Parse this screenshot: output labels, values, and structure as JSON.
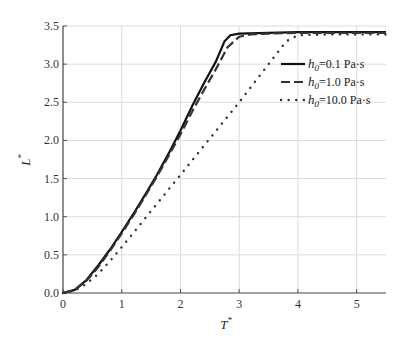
{
  "chart_data": {
    "type": "line",
    "title": "",
    "xlabel": "T*",
    "ylabel": "L*",
    "xlim": [
      0,
      5.5
    ],
    "ylim": [
      0,
      3.5
    ],
    "xticks": [
      "0",
      "1",
      "2",
      "3",
      "4",
      "5"
    ],
    "yticks": [
      "0.0",
      "0.5",
      "1.0",
      "1.5",
      "2.0",
      "2.5",
      "3.0",
      "3.5"
    ],
    "grid": true,
    "legend_position": "upper right",
    "series": [
      {
        "name": "h0 = 0.1 Pa·s",
        "style": "solid",
        "x": [
          0,
          0.2,
          0.4,
          0.6,
          0.8,
          1.0,
          1.2,
          1.4,
          1.6,
          1.8,
          2.0,
          2.2,
          2.4,
          2.6,
          2.75,
          2.85,
          3.0,
          3.5,
          4.0,
          4.5,
          5.0,
          5.5
        ],
        "y": [
          0,
          0.04,
          0.17,
          0.36,
          0.57,
          0.8,
          1.04,
          1.29,
          1.55,
          1.83,
          2.13,
          2.45,
          2.75,
          3.03,
          3.3,
          3.38,
          3.4,
          3.41,
          3.42,
          3.42,
          3.42,
          3.42
        ]
      },
      {
        "name": "h0 = 1.0 Pa·s",
        "style": "dashed",
        "x": [
          0,
          0.2,
          0.4,
          0.6,
          0.8,
          1.0,
          1.2,
          1.4,
          1.6,
          1.8,
          2.0,
          2.2,
          2.4,
          2.6,
          2.8,
          3.0,
          3.2,
          3.5,
          4.0,
          4.5,
          5.0,
          5.5
        ],
        "y": [
          0,
          0.04,
          0.16,
          0.34,
          0.55,
          0.78,
          1.02,
          1.27,
          1.53,
          1.8,
          2.08,
          2.38,
          2.66,
          2.93,
          3.22,
          3.36,
          3.39,
          3.4,
          3.41,
          3.41,
          3.41,
          3.41
        ]
      },
      {
        "name": "h0 = 10.0 Pa·s",
        "style": "dotted",
        "x": [
          0,
          0.2,
          0.4,
          0.6,
          0.8,
          1.0,
          1.2,
          1.4,
          1.6,
          1.8,
          2.0,
          2.2,
          2.4,
          2.6,
          2.8,
          3.0,
          3.2,
          3.4,
          3.6,
          3.8,
          4.0,
          4.5,
          5.0,
          5.5
        ],
        "y": [
          0,
          0.03,
          0.12,
          0.25,
          0.42,
          0.6,
          0.79,
          0.98,
          1.17,
          1.36,
          1.55,
          1.74,
          1.93,
          2.12,
          2.31,
          2.5,
          2.7,
          2.9,
          3.1,
          3.3,
          3.38,
          3.39,
          3.39,
          3.39
        ]
      }
    ]
  },
  "legend": {
    "items": [
      {
        "sym": "h",
        "sub": "0",
        "text": "=0.1 Pa·s"
      },
      {
        "sym": "h",
        "sub": "0",
        "text": "=1.0 Pa·s"
      },
      {
        "sym": "h",
        "sub": "0",
        "text": "=10.0 Pa·s"
      }
    ]
  },
  "axes": {
    "xlabel": "T",
    "ylabel": "L",
    "star": "*"
  }
}
